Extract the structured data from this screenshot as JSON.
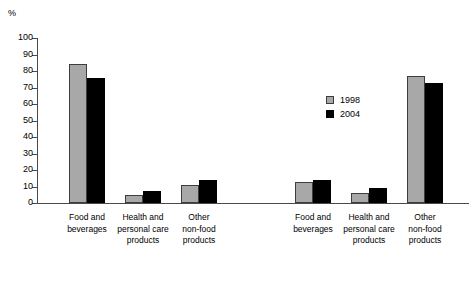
{
  "chart_data": {
    "type": "bar",
    "title": "",
    "subtitle": "",
    "xlabel": "",
    "ylabel": "%",
    "ylim": [
      0,
      100
    ],
    "ytick_step": 10,
    "yticks": [
      100,
      90,
      80,
      70,
      60,
      50,
      40,
      30,
      20,
      10,
      0
    ],
    "grid": false,
    "legend_position": "center",
    "legend": [
      {
        "name": "1998",
        "color": "#a8a8a8"
      },
      {
        "name": "2004",
        "color": "#000000"
      }
    ],
    "panels": [
      {
        "name": "left-panel",
        "categories": [
          "Food and\nbeverages",
          "Health and\npersonal care\nproducts",
          "Other\nnon-food\nproducts"
        ],
        "series": [
          {
            "name": "1998",
            "values": [
              84,
              5,
              11
            ]
          },
          {
            "name": "2004",
            "values": [
              76,
              7,
              14
            ]
          }
        ]
      },
      {
        "name": "right-panel",
        "categories": [
          "Food and\nbeverages",
          "Health and\npersonal care\nproducts",
          "Other\nnon-food\nproducts"
        ],
        "series": [
          {
            "name": "1998",
            "values": [
              13,
              6,
              77
            ]
          },
          {
            "name": "2004",
            "values": [
              14,
              9,
              73
            ]
          }
        ]
      }
    ]
  },
  "axis": {
    "unit_label": "%",
    "tick_labels": [
      "100",
      "90",
      "80",
      "70",
      "60",
      "50",
      "40",
      "30",
      "20",
      "10",
      "0"
    ]
  },
  "legend": {
    "items": [
      {
        "label": "1998"
      },
      {
        "label": "2004"
      }
    ]
  },
  "categories": {
    "left": [
      "Food and\nbeverages",
      "Health and\npersonal care\nproducts",
      "Other\nnon-food\nproducts"
    ],
    "right": [
      "Food and\nbeverages",
      "Health and\npersonal care\nproducts",
      "Other\nnon-food\nproducts"
    ]
  }
}
